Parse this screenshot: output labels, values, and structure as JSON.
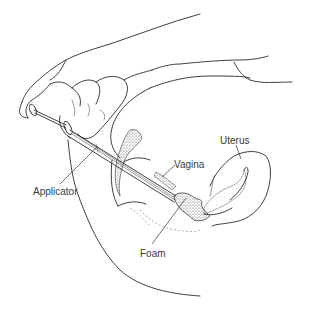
{
  "figure": {
    "labels": [
      {
        "key": "applicator",
        "text": "Applicator",
        "x": 33,
        "y": 187
      },
      {
        "key": "vagina",
        "text": "Vagina",
        "x": 174,
        "y": 160
      },
      {
        "key": "uterus",
        "text": "Uterus",
        "x": 220,
        "y": 136
      },
      {
        "key": "foam",
        "text": "Foam",
        "x": 140,
        "y": 249
      }
    ]
  },
  "labels": {
    "applicator": "Applicator",
    "vagina": "Vagina",
    "uterus": "Uterus",
    "foam": "Foam"
  },
  "colors": {
    "background": "#ffffff",
    "line": "#2a2a2a",
    "label": "#3a3a3a"
  }
}
